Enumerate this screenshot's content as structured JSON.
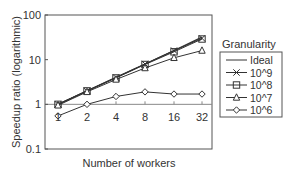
{
  "chart_data": {
    "type": "line",
    "title": "",
    "xlabel": "Number of workers",
    "ylabel": "Speedup ratio (logarithmic)",
    "x": [
      1,
      2,
      4,
      8,
      16,
      32
    ],
    "x_tick_labels": [
      "1",
      "2",
      "4",
      "8",
      "16",
      "32"
    ],
    "y_scale": "log",
    "ylim": [
      0.1,
      100
    ],
    "y_tick_labels": [
      "0.1",
      "1",
      "10",
      "100"
    ],
    "reference_line": 1,
    "legend_title": "Granularity",
    "legend_position": "right",
    "series": [
      {
        "name": "Ideal",
        "marker": "none",
        "values": [
          1,
          2,
          4,
          8,
          16,
          32
        ]
      },
      {
        "name": "10^9",
        "marker": "x",
        "values": [
          1,
          2,
          4,
          8,
          16,
          30
        ]
      },
      {
        "name": "10^8",
        "marker": "square",
        "values": [
          1,
          2,
          3.9,
          7.8,
          15,
          29
        ]
      },
      {
        "name": "10^7",
        "marker": "triangle",
        "values": [
          0.95,
          1.9,
          3.6,
          6.5,
          11,
          16
        ]
      },
      {
        "name": "10^6",
        "marker": "diamond",
        "values": [
          0.55,
          1.0,
          1.5,
          1.9,
          1.7,
          1.7
        ]
      }
    ]
  }
}
